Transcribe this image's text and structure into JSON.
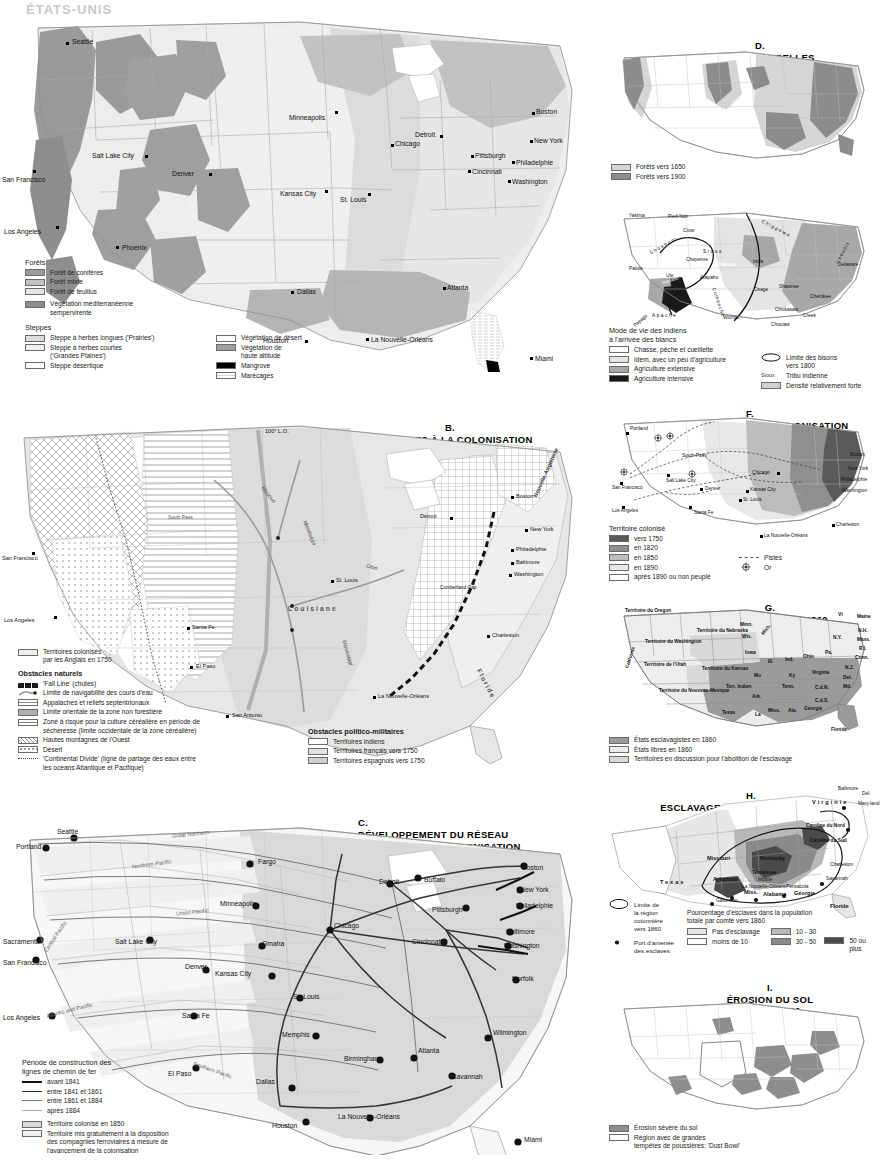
{
  "page": {
    "header": "ÉTATS-UNIS"
  },
  "maps": {
    "A": {
      "letter": "A.",
      "title": "VÉGÉTATION NATURELLE",
      "scale": "1 : 30 000 000",
      "legend": {
        "forests_head": "Forêts",
        "forests": [
          {
            "label": "Forêt de conifères",
            "color": "#9a9a9a"
          },
          {
            "label": "Forêt mixte",
            "color": "#c2c2c2"
          },
          {
            "label": "Forêt de feuillus",
            "color": "#e6e6e6"
          },
          {
            "label": "Végétation méditerranéenne\nsempervirente",
            "color": "#8e8e8e"
          }
        ],
        "steppes_head": "Steppes",
        "steppes": [
          {
            "label": "Steppe à herbes longues ('Prairies')",
            "color": "#dcdcdc"
          },
          {
            "label": "Steppe à herbes courtes\n('Grandes Plaines')",
            "color": "#efefef"
          },
          {
            "label": "Steppe désertique",
            "color": "#ffffff"
          }
        ],
        "other": [
          {
            "label": "Végétation de désert",
            "color": "#ffffff"
          },
          {
            "label": "Végétation de\nhaute altitude",
            "color": "#9f9f9f"
          },
          {
            "label": "Mangrove",
            "color": "#000000"
          },
          {
            "label": "Marécages",
            "color": "#f2f2f2"
          }
        ]
      },
      "cities": [
        "Seattle",
        "San Francisco",
        "Los Angeles",
        "Salt Lake City",
        "Denver",
        "Phoenix",
        "Minneapolis",
        "Kansas City",
        "St. Louis",
        "Chicago",
        "Detroit",
        "Cincinnati",
        "Pittsburgh",
        "Washington",
        "Philadelphie",
        "New York",
        "Boston",
        "Dallas",
        "Houston",
        "La Nouvelle-Orléans",
        "Atlanta",
        "Miami"
      ]
    },
    "B": {
      "letter": "B.",
      "title": "OBSTACLES À LA COLONISATION",
      "scale": "1 : 30 000 000",
      "legend": {
        "colonised": "Territoires colonisés\npar les Anglais en 1750",
        "natural_head": "Obstacles naturels",
        "natural": [
          {
            "label": "'Fall Line' (chutes)",
            "kind": "dashes"
          },
          {
            "label": "Limite de navigabilité des cours d'eau",
            "kind": "river"
          },
          {
            "label": "Appalaches et reliefs septentrionaux",
            "kind": "grid"
          },
          {
            "label": "Limite orientale de la zone non forestière",
            "kind": "solidbar"
          },
          {
            "label": "Zone à risque pour la culture céréalière en période de\nsécheresse (limite occidentale de la zone céréalière)",
            "kind": "hlines"
          },
          {
            "label": "Hautes montagnes de l'Ouest",
            "kind": "crosshatch"
          },
          {
            "label": "Désert",
            "kind": "dots"
          },
          {
            "label": "'Continental Divide' (ligne de partage des eaux entre\nles océans Atlantique et Pacifique)",
            "kind": "dotline"
          }
        ],
        "polmil_head": "Obstacles politico-militaires",
        "polmil": [
          {
            "label": "Territoires indiens",
            "color": "#ffffff"
          },
          {
            "label": "Territoires français vers 1750",
            "color": "#e2e2e2"
          },
          {
            "label": "Territoires espagnols vers 1750",
            "color": "#cfcfcf"
          }
        ]
      },
      "annotations": [
        "100° L.O.",
        "Louisiane",
        "Nouvelle-Angleterre",
        "Floride",
        "Cumberland Gap",
        "South Pass"
      ],
      "rivers": [
        "Missouri",
        "Mississippi",
        "Ohio",
        "Mississippi"
      ],
      "cities": [
        "San Francisco",
        "Los Angeles",
        "El Paso",
        "San Antonio",
        "Santa Fe",
        "St. Louis",
        "Detroit",
        "Boston",
        "New York",
        "Philadelphie",
        "Baltimore",
        "Washington",
        "Charleston",
        "La Nouvelle-Orléans"
      ]
    },
    "C": {
      "letter": "C.",
      "title": "DÉVELOPPEMENT DU RÉSEAU\nFERROVIAIRE ET COLONISATION",
      "scale": "1 : 30 000 000",
      "legend": {
        "head": "Période de construction des\nlignes de chemin de fer",
        "periods": [
          {
            "label": "avant 1841",
            "weight": 2.4,
            "color": "#111111"
          },
          {
            "label": "entre 1841 et 1861",
            "weight": 1.6,
            "color": "#333333"
          },
          {
            "label": "entre 1861 et 1884",
            "weight": 1.0,
            "color": "#7a7a7a"
          },
          {
            "label": "après 1884",
            "weight": 0.6,
            "color": "#b0b0b0"
          }
        ],
        "areas": [
          {
            "label": "Territoire colonisé en 1850",
            "color": "#d9d9d9"
          },
          {
            "label": "Territoire mis gratuitement à la disposition\ndes compagnies ferroviaires à mesure de\nl'avancement de la colonisation",
            "color": "#efefef"
          }
        ]
      },
      "railroads": [
        "Great Northern",
        "Northern Pacific",
        "Union Pacific",
        "Central Pacific",
        "Atlantic and Pacific",
        "Southern Pacific"
      ],
      "cities": [
        "Portland",
        "Seattle",
        "Sacramento",
        "San Francisco",
        "Los Angeles",
        "Salt Lake City",
        "Denver",
        "Santa Fe",
        "El Paso",
        "Fargo",
        "Minneapolis",
        "Omaha",
        "Kansas City",
        "St. Louis",
        "Chicago",
        "Detroit",
        "Buffalo",
        "Boston",
        "New York",
        "Philadelphie",
        "Pittsburgh",
        "Baltimore",
        "Washington",
        "Cincinnati",
        "Norfolk",
        "Memphis",
        "Birmingham",
        "Atlanta",
        "Savannah",
        "Wilmington",
        "Dallas",
        "Houston",
        "La Nouvelle-Orléans",
        "Miami"
      ]
    },
    "D": {
      "letter": "D.",
      "title": "FORÊTS NATURELLES",
      "scale": "1 : 65 000 000",
      "legend": [
        {
          "label": "Forêts vers 1650",
          "color": "#d5d5d5"
        },
        {
          "label": "Forêts vers 1900",
          "color": "#8c8c8c"
        }
      ]
    },
    "E": {
      "letter": "E.",
      "title": "AUTOCHTONES",
      "scale": "1 : 65 000 000",
      "legend": {
        "head": "Mode de vie des indiens\nà l'arrivée des blancs",
        "items": [
          {
            "label": "Chasse, pêche et cueillette",
            "color": "#ffffff"
          },
          {
            "label": "Idem, avec un peu d'agriculture",
            "color": "#e4e4e4"
          },
          {
            "label": "Agriculture extensive",
            "color": "#a8a8a8"
          },
          {
            "label": "Agriculture intensive",
            "color": "#1a1a1a"
          }
        ],
        "right": [
          {
            "label": "Limite des bisons\nvers 1800",
            "kind": "ellipse"
          },
          {
            "label": "Tribu indienne",
            "kind": "tribe",
            "sample": "Sioux"
          },
          {
            "label": "Densité relativement forte",
            "kind": "swatch",
            "color": "#d0d0d0"
          }
        ]
      },
      "tribes": [
        "Yakima",
        "Pied-Noir",
        "Crow",
        "Sioux",
        "Chippewa",
        "Shoshoni",
        "Cheyenne",
        "Paiute",
        "Ute",
        "Arapaho",
        "Pawnee",
        "Iowa",
        "Osage",
        "Shawnee",
        "Iroquois",
        "Delaware",
        "Cherokee",
        "Chickasaw",
        "Creek",
        "Choctaw",
        "Wichita",
        "Comanche",
        "Apache",
        "Papago",
        "Navaho"
      ]
    },
    "F": {
      "letter": "F.",
      "title": "AVANCÉE DU FRONT DE COLONISATION",
      "scale": "1 : 65 000 000",
      "legend": {
        "head": "Territoire colonisé",
        "items": [
          {
            "label": "vers 1750",
            "color": "#5a5a5a"
          },
          {
            "label": "en 1820",
            "color": "#8f8f8f"
          },
          {
            "label": "en 1850",
            "color": "#bcbcbc"
          },
          {
            "label": "en 1890",
            "color": "#e8e8e8"
          },
          {
            "label": "après 1890 ou non peuplé",
            "color": "#ffffff"
          }
        ],
        "right": [
          {
            "label": "Pistes",
            "kind": "trail"
          },
          {
            "label": "Or",
            "kind": "gold"
          }
        ]
      },
      "places": [
        "Portland",
        "San Francisco",
        "Los Angeles",
        "Salt Lake City",
        "South Pass",
        "Denver",
        "Santa Fe",
        "Chicago",
        "Kansas City",
        "St. Louis",
        "Boston",
        "New York",
        "Philadelphie",
        "Washington",
        "Charleston",
        "La Nouvelle-Orléans"
      ]
    },
    "G": {
      "letter": "G.",
      "title": "ESCLAVAGE VERS 1860",
      "scale": "1 : 65 000 000",
      "legend": [
        {
          "label": "États esclavagistes en 1860",
          "color": "#9b9b9b"
        },
        {
          "label": "États libres en 1860",
          "color": "#ededed"
        },
        {
          "label": "Territoires en discussion pour l'abolition de l'esclavage",
          "color": "#d8d8d8"
        }
      ],
      "states": [
        "Territoire du Oregon",
        "Territoire du Washington",
        "Californie",
        "Territoire de l'Utah",
        "Territoire du Nouveau-Mexique",
        "Territoire du Nebraska",
        "Territoire du Kansas",
        "Terr. Indien",
        "Texas",
        "Minn.",
        "Wis.",
        "Mich.",
        "Iowa",
        "Mo",
        "Ark.",
        "La",
        "Miss.",
        "Ala.",
        "Géorgie",
        "Floride",
        "Tenn.",
        "Ky",
        "Ill.",
        "Ind.",
        "Ohio",
        "Virginie",
        "C.d.N.",
        "C.d.S.",
        "Pa.",
        "N.Y.",
        "Vt",
        "Maine",
        "N.H.",
        "Mass.",
        "R.I.",
        "Conn.",
        "N.J.",
        "Del.",
        "Md."
      ]
    },
    "H": {
      "letter": "H.",
      "title": "ESCLAVAGE ET CULTURE DU COTON",
      "scale": "1 : 40 000 000",
      "legend": {
        "left": [
          {
            "label": "Limite de\nla région\ncotonnière\nvers 1860",
            "kind": "ellipse"
          },
          {
            "label": "Port d'amenée\ndes esclaves",
            "kind": "port"
          }
        ],
        "pct_head": "Pourcentage d'esclaves dans la population\ntotale par comté vers 1860",
        "pct": [
          {
            "label": "Pas d'esclavage",
            "color": "#e6e6e6"
          },
          {
            "label": "moins de 10",
            "color": "#ffffff"
          },
          {
            "label": "10 - 30",
            "color": "#b9b9b9"
          },
          {
            "label": "30 - 50",
            "color": "#8a8a8a"
          },
          {
            "label": "50 ou plus",
            "color": "#4a4a4a"
          }
        ]
      },
      "places": [
        "Texas",
        "Missouri",
        "Arkansas",
        "Kentucky",
        "Tennessee",
        "Miss.",
        "Alabama",
        "Géorgie",
        "Virginie",
        "Caroline du Nord",
        "Caroline du Sud",
        "Floride",
        "Baltimore",
        "Del.",
        "Mary-land",
        "Charleston",
        "Savannah",
        "Mobile",
        "Pensacola",
        "Galveston",
        "La Nouvelle-Orléans"
      ]
    },
    "I": {
      "letter": "I.",
      "title": "ÉROSION DU SOL",
      "scale": "1 : 65 000 000",
      "legend": [
        {
          "label": "Érosion sévère du sol",
          "color": "#8e8e8e"
        },
        {
          "label": "Région avec de grandes\ntempêtes de poussières: 'Dust Bowl'",
          "color": "#ffffff"
        }
      ]
    }
  }
}
